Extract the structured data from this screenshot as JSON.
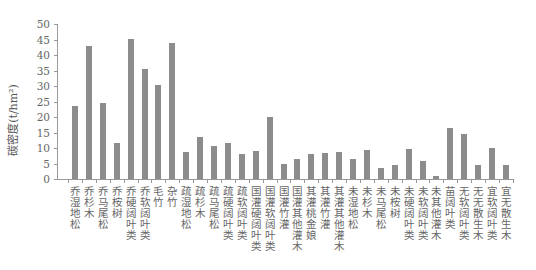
{
  "chart_data": {
    "type": "bar",
    "title": "",
    "xlabel": "",
    "ylabel": "碳密度(t/hm²)",
    "ylim": [
      0,
      50
    ],
    "yticks": [
      0,
      5,
      10,
      15,
      20,
      25,
      30,
      35,
      40,
      45,
      50
    ],
    "grid": false,
    "legend": null,
    "bar_color": "#8c8c8c",
    "categories": [
      "乔 湿地松",
      "乔 杉木",
      "乔 马尾松",
      "乔 桉树",
      "乔 硬阔叶类",
      "乔软阔叶类",
      "毛竹",
      "杂竹",
      "疏 湿地松",
      "疏 杉木",
      "疏 马尾松",
      "疏 硬阔叶类",
      "疏 软阔叶类",
      "国灌 硬阔叶类",
      "国灌 软阔叶类",
      "国灌 竹灌",
      "国灌 其他灌木",
      "其灌 桃金娘",
      "其灌 竹灌",
      "其灌 其他灌木",
      "未 湿地松",
      "未 杉木",
      "未 马尾松",
      "未 桉树",
      "未 硬阔叶类",
      "未 软阔叶类",
      "未 其他灌木",
      "苗阔叶类",
      "无 软阔叶类",
      "无 无散生木",
      "宜 软阔叶类",
      "宜 无散生木"
    ],
    "values": [
      23.5,
      42.9,
      24.4,
      11.6,
      45.2,
      35.5,
      30.3,
      43.9,
      8.8,
      13.4,
      10.6,
      11.6,
      8.1,
      9.0,
      19.9,
      5.0,
      6.5,
      8.1,
      8.5,
      8.7,
      6.3,
      9.4,
      3.6,
      4.4,
      9.6,
      5.8,
      1.0,
      16.5,
      14.6,
      4.4,
      10.0,
      4.4
    ]
  }
}
